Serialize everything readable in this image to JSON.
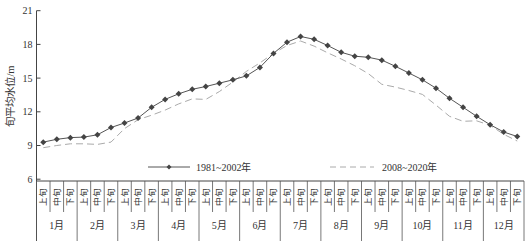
{
  "chart_data": {
    "type": "line",
    "title": "",
    "xlabel": "",
    "ylabel": "旬平均水位/m",
    "ylim": [
      6,
      21
    ],
    "yticks": [
      6,
      9,
      12,
      15,
      18,
      21
    ],
    "grid": false,
    "legend_position": "inside-bottom",
    "months": [
      "1月",
      "2月",
      "3月",
      "4月",
      "5月",
      "6月",
      "7月",
      "8月",
      "9月",
      "10月",
      "11月",
      "12月"
    ],
    "dekads": [
      "上旬",
      "中旬",
      "下旬"
    ],
    "categories": [
      "1月上旬",
      "1月中旬",
      "1月下旬",
      "2月上旬",
      "2月中旬",
      "2月下旬",
      "3月上旬",
      "3月中旬",
      "3月下旬",
      "4月上旬",
      "4月中旬",
      "4月下旬",
      "5月上旬",
      "5月中旬",
      "5月下旬",
      "6月上旬",
      "6月中旬",
      "6月下旬",
      "7月上旬",
      "7月中旬",
      "7月下旬",
      "8月上旬",
      "8月中旬",
      "8月下旬",
      "9月上旬",
      "9月中旬",
      "9月下旬",
      "10月上旬",
      "10月中旬",
      "10月下旬",
      "11月上旬",
      "11月中旬",
      "11月下旬",
      "12月上旬",
      "12月中旬",
      "12月下旬"
    ],
    "series": [
      {
        "name": "1981~2002年",
        "style": "solid-marker",
        "color": "#555555",
        "values": [
          9.3,
          9.55,
          9.7,
          9.75,
          9.95,
          10.6,
          11.0,
          11.45,
          12.4,
          13.1,
          13.6,
          14.0,
          14.25,
          14.55,
          14.85,
          15.2,
          15.95,
          17.2,
          18.2,
          18.7,
          18.45,
          17.9,
          17.3,
          16.95,
          16.85,
          16.6,
          16.05,
          15.45,
          14.85,
          14.1,
          13.2,
          12.4,
          11.6,
          10.85,
          10.2,
          9.8
        ]
      },
      {
        "name": "2008~2020年",
        "style": "dashed",
        "color": "#aaaaaa",
        "values": [
          8.8,
          9.0,
          9.15,
          9.15,
          9.1,
          9.3,
          10.5,
          11.3,
          11.7,
          12.15,
          12.7,
          13.15,
          13.1,
          13.8,
          14.65,
          15.6,
          16.35,
          17.2,
          17.9,
          18.3,
          17.85,
          17.25,
          16.7,
          16.1,
          15.4,
          14.45,
          14.2,
          13.9,
          13.55,
          12.6,
          11.6,
          11.15,
          11.2,
          10.8,
          10.0,
          9.4
        ]
      }
    ]
  }
}
